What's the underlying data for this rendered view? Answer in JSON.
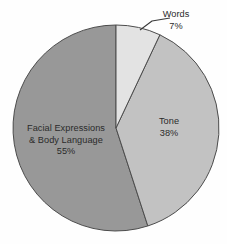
{
  "chart_data": {
    "type": "pie",
    "title": "",
    "subtitle": "",
    "xlabel": "",
    "ylabel": "",
    "legend_position": "none",
    "grid": false,
    "unit": "%",
    "categories": [
      "Words",
      "Tone",
      "Facial Expressions & Body Language"
    ],
    "values": [
      7,
      38,
      55
    ],
    "slices": [
      {
        "label": "Words",
        "label_line1": "Words",
        "value": 7,
        "value_text": "7%",
        "color": "#e3e3e3",
        "start_angle_deg": 0,
        "end_angle_deg": 25.2,
        "label_placement": "outside-callout"
      },
      {
        "label": "Tone",
        "label_line1": "Tone",
        "value": 38,
        "value_text": "38%",
        "color": "#c2c2c2",
        "start_angle_deg": 25.2,
        "end_angle_deg": 162.0,
        "label_placement": "inside"
      },
      {
        "label": "Facial Expressions & Body Language",
        "label_line1": "Facial Expressions",
        "label_line2": "& Body Language",
        "value": 55,
        "value_text": "55%",
        "color": "#989898",
        "start_angle_deg": 162.0,
        "end_angle_deg": 360.0,
        "label_placement": "inside"
      }
    ],
    "geometry": {
      "center_x": 116,
      "center_y": 128,
      "radius": 103,
      "start_angle_deg": 0,
      "direction": "clockwise"
    },
    "style": {
      "background": "#fefefe",
      "stroke_color": "#4c4c4c",
      "stroke_width": 1,
      "label_color": "#2b2b2b",
      "callout_line_color": "#3a3a3a"
    }
  }
}
